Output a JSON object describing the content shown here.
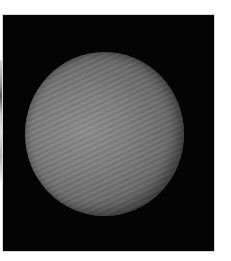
{
  "image": {
    "subject": "gray banded sphere (planetary body) on black background",
    "background_color": "#040404",
    "sphere_color_center": "#7f7f7f",
    "sphere_color_edge": "#3a3a3a",
    "border_color": "#ffffff"
  }
}
